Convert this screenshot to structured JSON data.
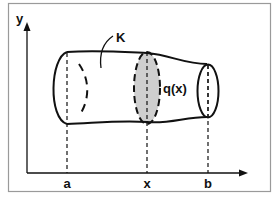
{
  "figure": {
    "axes": {
      "y_label": "y",
      "x_ticks": [
        {
          "label": "a",
          "x": 67
        },
        {
          "label": "x",
          "x": 147
        },
        {
          "label": "b",
          "x": 207
        }
      ]
    },
    "solid": {
      "label": "K",
      "cross_section_label": "q(x)"
    },
    "colors": {
      "frame": "#9a9a9a",
      "stroke": "#111111",
      "cross_section_fill": "#cfcfcf"
    }
  }
}
